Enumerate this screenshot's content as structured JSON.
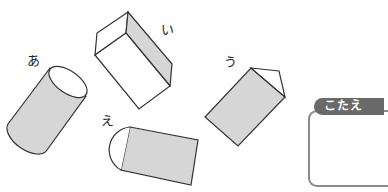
{
  "figures": {
    "a": {
      "label": "あ",
      "shape": "cylinder"
    },
    "i": {
      "label": "い",
      "shape": "rectangular-prism"
    },
    "u": {
      "label": "う",
      "shape": "triangular-prism"
    },
    "e": {
      "label": "え",
      "shape": "half-cylinder"
    }
  },
  "answer": {
    "tab_label": "こたえ",
    "value": ""
  },
  "colors": {
    "fill": "#d6d6d6",
    "stroke": "#333333",
    "tab": "#6a6a6a"
  }
}
